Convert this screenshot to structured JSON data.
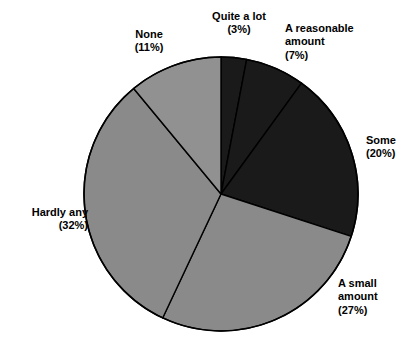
{
  "chart_data": {
    "type": "pie",
    "title": "",
    "subtitle": "",
    "xlabel": "",
    "ylabel": "",
    "legend_position": "none",
    "grid": false,
    "start_angle_deg": 0,
    "direction": "clockwise",
    "center": {
      "x": 221,
      "y": 194
    },
    "radius": 137,
    "outline_color": "#000000",
    "categories": [
      "Quite a lot",
      "A reasonable amount",
      "Some",
      "A small amount",
      "Hardly any",
      "None"
    ],
    "values": [
      3,
      7,
      20,
      27,
      32,
      11
    ],
    "value_unit": "%",
    "slices": [
      {
        "label": "Quite a lot",
        "value": 3,
        "percent_text": "(3%)",
        "label_text": "Quite a lot\n(3%)",
        "color": "#1a1a1a",
        "start_deg": 0,
        "end_deg": 10.8
      },
      {
        "label": "A reasonable amount",
        "value": 7,
        "percent_text": "(7%)",
        "label_text": "A reasonable\namount\n(7%)",
        "color": "#1a1a1a",
        "start_deg": 10.8,
        "end_deg": 36
      },
      {
        "label": "Some",
        "value": 20,
        "percent_text": "(20%)",
        "label_text": "Some\n(20%)",
        "color": "#1a1a1a",
        "start_deg": 36,
        "end_deg": 108
      },
      {
        "label": "A small amount",
        "value": 27,
        "percent_text": "(27%)",
        "label_text": "A small\namount\n(27%)",
        "color": "#8a8a8a",
        "start_deg": 108,
        "end_deg": 205.2
      },
      {
        "label": "Hardly any",
        "value": 32,
        "percent_text": "(32%)",
        "label_text": "Hardly any\n(32%)",
        "color": "#8a8a8a",
        "start_deg": 205.2,
        "end_deg": 320.4
      },
      {
        "label": "None",
        "value": 11,
        "percent_text": "(11%)",
        "label_text": "None\n(11%)",
        "color": "#919191",
        "start_deg": 320.4,
        "end_deg": 360
      }
    ]
  },
  "figure": {
    "background": "#ffffff",
    "title_clipped": "Chart title is cut off at the top edge of the image"
  }
}
